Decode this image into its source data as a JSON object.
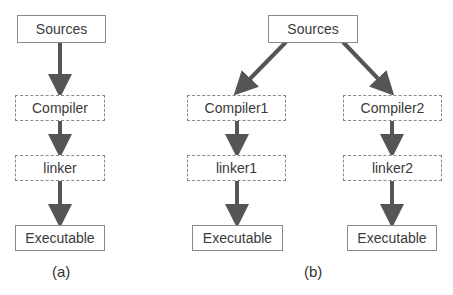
{
  "diagram_a": {
    "caption": "(a)",
    "nodes": {
      "sources": "Sources",
      "compiler": "Compiler",
      "linker": "linker",
      "executable": "Executable"
    }
  },
  "diagram_b": {
    "caption": "(b)",
    "nodes": {
      "sources": "Sources",
      "compiler1": "Compiler1",
      "compiler2": "Compiler2",
      "linker1": "linker1",
      "linker2": "linker2",
      "executable1": "Executable",
      "executable2": "Executable"
    }
  },
  "colors": {
    "arrow": "#555555",
    "border": "#8a8a8a"
  }
}
